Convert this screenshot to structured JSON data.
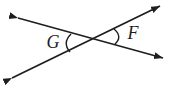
{
  "figure": {
    "angle_labels": {
      "g": "G",
      "f": "F"
    },
    "colors": {
      "line": "#1e1e1e",
      "background": "#ffffff"
    }
  }
}
